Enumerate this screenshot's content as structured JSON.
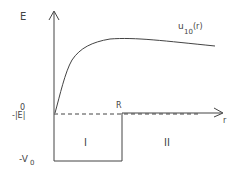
{
  "diagram": {
    "type": "square-well potential with radial wavefunction",
    "labels": {
      "y_axis": "E",
      "x_axis": "r",
      "curve_main": "u",
      "curve_sub": "10",
      "curve_arg": "(r)",
      "zero": "0",
      "energy_level": "-|E|",
      "well_depth": "-V",
      "well_depth_sub": "0",
      "radius": "R",
      "region_1": "I",
      "region_2": "II"
    },
    "colors": {
      "line": "#444444",
      "background": "#ffffff"
    }
  }
}
